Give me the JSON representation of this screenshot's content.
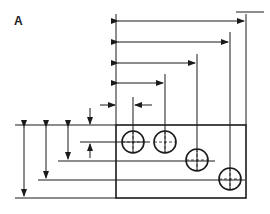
{
  "figure": {
    "label": "A",
    "colors": {
      "line": "#1a1a1a",
      "background": "#ffffff"
    },
    "plate": {
      "x": 116,
      "y": 125,
      "w": 130,
      "h": 73
    },
    "holes": [
      {
        "cx": 133,
        "cy": 142,
        "r": 11
      },
      {
        "cx": 165,
        "cy": 142,
        "r": 11
      },
      {
        "cx": 197,
        "cy": 160,
        "r": 11
      },
      {
        "cx": 230,
        "cy": 179,
        "r": 11
      }
    ],
    "horizontal_dimensions": [
      {
        "y": 21,
        "x1": 116,
        "x2": 246
      },
      {
        "y": 42,
        "x1": 116,
        "x2": 230
      },
      {
        "y": 63,
        "x1": 116,
        "x2": 197
      },
      {
        "y": 83,
        "x1": 116,
        "x2": 165
      }
    ],
    "vertical_dimensions": [
      {
        "x": 24,
        "y1": 125,
        "y2": 198
      },
      {
        "x": 46,
        "y1": 125,
        "y2": 179
      },
      {
        "x": 68,
        "y1": 125,
        "y2": 160
      }
    ]
  }
}
